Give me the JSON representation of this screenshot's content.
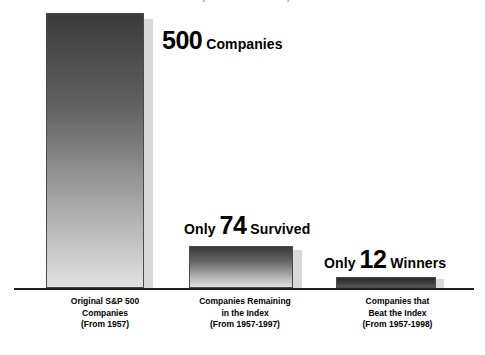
{
  "chart_data": {
    "type": "bar",
    "title": "Mortality of the Indexed Companies",
    "xlabel": "",
    "ylabel": "",
    "ylim": [
      0,
      500
    ],
    "grid": false,
    "legend": "none",
    "categories": [
      "Original S&P 500 Companies (From 1957)",
      "Companies Remaining in the Index (From 1957-1997)",
      "Companies that Beat the Index (From 1957-1998)"
    ],
    "values": [
      500,
      74,
      12
    ],
    "annotations": [
      "500 Companies",
      "Only 74 Survived",
      "Only 12 Winners"
    ]
  },
  "title": {
    "text": "Mortality of the Indexed Companies"
  },
  "bars": [
    {
      "id": "bar-1",
      "value": 500,
      "callout": {
        "prefix": "",
        "value": "500",
        "suffix": "Companies"
      },
      "label_lines": [
        "Original S&P 500",
        "Companies",
        "(From 1957)"
      ]
    },
    {
      "id": "bar-2",
      "value": 74,
      "callout": {
        "prefix": "Only",
        "value": "74",
        "suffix": "Survived"
      },
      "label_lines": [
        "Companies Remaining",
        "in the Index",
        "(From 1957-1997)"
      ]
    },
    {
      "id": "bar-3",
      "value": 12,
      "callout": {
        "prefix": "Only",
        "value": "12",
        "suffix": "Winners"
      },
      "label_lines": [
        "Companies that",
        "Beat the Index",
        "(From 1957-1998)"
      ]
    }
  ],
  "labels": {
    "cat1_line1": "Original S&P 500",
    "cat1_line2": "Companies",
    "cat1_line3": "(From 1957)",
    "cat2_line1": "Companies Remaining",
    "cat2_line2": "in the Index",
    "cat2_line3": "(From 1957-1997)",
    "cat3_line1": "Companies that",
    "cat3_line2": "Beat the Index",
    "cat3_line3": "(From 1957-1998)"
  },
  "colors": {
    "bar_top": "#3a3a3a",
    "bar_bottom": "#e2e2e2",
    "bar_border": "#4a4a4a",
    "bar_shadow": "#d9d9d9",
    "axis": "#231f20",
    "text": "#000000",
    "background": "#ffffff"
  }
}
